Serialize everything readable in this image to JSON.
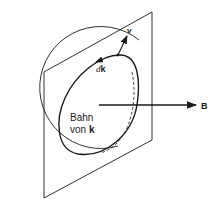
{
  "figure": {
    "orbit_label": {
      "line1": "Bahn",
      "line2_prefix": "von ",
      "line2_symbol": "k"
    },
    "dk_label": {
      "prefix": "d",
      "symbol": "k"
    },
    "velocity_label": "v",
    "field_label": "B",
    "colors": {
      "stroke": "#1a1a1a",
      "background": "#ffffff"
    }
  }
}
